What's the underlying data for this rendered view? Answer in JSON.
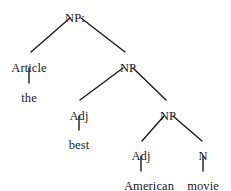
{
  "figure": {
    "kind": "syntax-tree",
    "background_color": "#ffffff",
    "line_color": "#1a1a1a",
    "text_color": "#1a1a1a"
  },
  "nodes": [
    {
      "id": "np-root",
      "label": "NP:",
      "type": "nonterminal",
      "x": 75,
      "y": 12
    },
    {
      "id": "article",
      "label": "Article",
      "type": "nonterminal",
      "x": 29,
      "y": 62
    },
    {
      "id": "np-2",
      "label": "NP",
      "type": "nonterminal",
      "x": 128,
      "y": 62
    },
    {
      "id": "adj-1",
      "label": "Adj",
      "type": "nonterminal",
      "x": 79,
      "y": 110
    },
    {
      "id": "np-3",
      "label": "NP",
      "type": "nonterminal",
      "x": 168,
      "y": 110
    },
    {
      "id": "adj-2",
      "label": "Adj",
      "type": "nonterminal",
      "x": 141,
      "y": 150
    },
    {
      "id": "n-1",
      "label": "N",
      "type": "nonterminal",
      "x": 203,
      "y": 150
    }
  ],
  "terminals": [
    {
      "id": "the",
      "label": "the",
      "x": 29,
      "y": 92
    },
    {
      "id": "best",
      "label": "best",
      "x": 79,
      "y": 139
    },
    {
      "id": "american",
      "label": "American",
      "x": 149,
      "y": 180
    },
    {
      "id": "movie",
      "label": "movie",
      "x": 203,
      "y": 180
    }
  ],
  "edges": [
    {
      "id": "edge-root-article",
      "from": "np-root",
      "to": "article",
      "x1": 70,
      "y1": 18,
      "x2": 31,
      "y2": 52
    },
    {
      "id": "edge-root-np2",
      "from": "np-root",
      "to": "np-2",
      "x1": 81,
      "y1": 18,
      "x2": 125,
      "y2": 52
    },
    {
      "id": "edge-article-the",
      "from": "article",
      "to": "the",
      "x1": 29,
      "y1": 68,
      "x2": 29,
      "y2": 83
    },
    {
      "id": "edge-np2-adj1",
      "from": "np-2",
      "to": "adj-1",
      "x1": 123,
      "y1": 68,
      "x2": 80,
      "y2": 100
    },
    {
      "id": "edge-np2-np3",
      "from": "np-2",
      "to": "np-3",
      "x1": 133,
      "y1": 68,
      "x2": 166,
      "y2": 100
    },
    {
      "id": "edge-adj1-best",
      "from": "adj-1",
      "to": "best",
      "x1": 79,
      "y1": 116,
      "x2": 79,
      "y2": 130
    },
    {
      "id": "edge-np3-adj2",
      "from": "np-3",
      "to": "adj-2",
      "x1": 164,
      "y1": 116,
      "x2": 142,
      "y2": 141
    },
    {
      "id": "edge-np3-n1",
      "from": "np-3",
      "to": "n-1",
      "x1": 173,
      "y1": 116,
      "x2": 202,
      "y2": 141
    },
    {
      "id": "edge-adj2-american",
      "from": "adj-2",
      "to": "american",
      "x1": 141,
      "y1": 156,
      "x2": 141,
      "y2": 171
    },
    {
      "id": "edge-n1-movie",
      "from": "n-1",
      "to": "movie",
      "x1": 203,
      "y1": 156,
      "x2": 203,
      "y2": 171
    }
  ]
}
